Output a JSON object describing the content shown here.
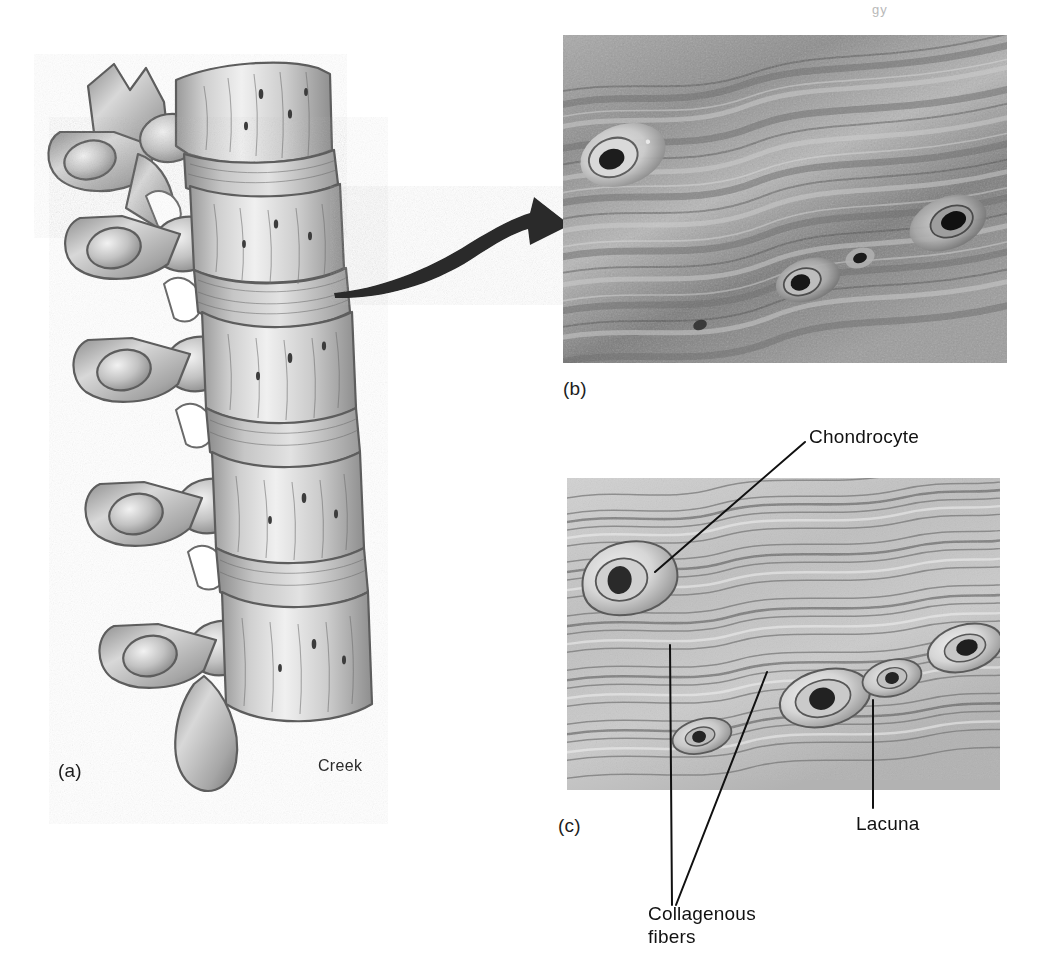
{
  "figure": {
    "page_header": "gy",
    "signature": "Creek",
    "background_color": "#ffffff"
  },
  "panels": [
    {
      "id": "a",
      "label": "(a)",
      "name": "vertebrae-illustration",
      "description": "Lateral view illustration of lumbar vertebrae separated by intervertebral discs",
      "tone": "grayscale pencil rendering"
    },
    {
      "id": "b",
      "label": "(b)",
      "name": "fibrocartilage-micrograph",
      "description": "Light micrograph of fibrocartilage showing wavy collagenous fiber bundles with chondrocytes in lacunae",
      "tone": "grayscale photomicrograph"
    },
    {
      "id": "c",
      "label": "(c)",
      "name": "fibrocartilage-diagram",
      "description": "Illustrated diagram of fibrocartilage matching the micrograph, with structures labeled",
      "tone": "grayscale illustration"
    }
  ],
  "annotations": {
    "chondrocyte": "Chondrocyte",
    "lacuna": "Lacuna",
    "collagenous_fibers_line1": "Collagenous",
    "collagenous_fibers_line2": "fibers"
  },
  "connector": {
    "name": "magnification-arrow",
    "from_panel": "a",
    "to_panel": "b",
    "style": "curved tapered arrow"
  },
  "colors": {
    "line": "#111111",
    "text": "#1a1a1a",
    "matrix_light": "#dcdcdc",
    "matrix_mid": "#b4b4b4",
    "matrix_dark": "#6f6f6f",
    "bone_light": "#e6e6e6",
    "bone_mid": "#b0b0b0",
    "bone_dark": "#6a6a6a",
    "nucleus": "#1e1e1e"
  }
}
